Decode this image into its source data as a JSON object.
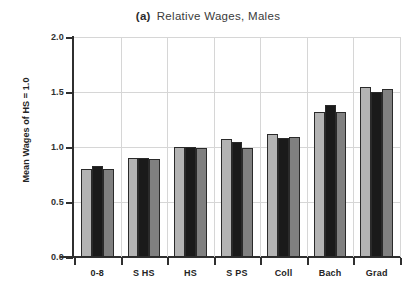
{
  "chart_data": {
    "type": "bar",
    "panel_letter": "(a)",
    "title_text": "Relative Wages, Males",
    "xlabel": "",
    "ylabel": "Mean Wages of HS = 1.0",
    "ylim": [
      0.0,
      2.0
    ],
    "yticks": [
      "0.0",
      "0.5",
      "1.0",
      "1.5",
      "2.0"
    ],
    "ytick_values": [
      0.0,
      0.5,
      1.0,
      1.5,
      2.0
    ],
    "grid": "horizontal-and-vertical",
    "legend": "none",
    "categories": [
      "0-8",
      "S HS",
      "HS",
      "S PS",
      "Coll",
      "Bach",
      "Grad"
    ],
    "series": [
      {
        "name": "series-1",
        "color": "#b3b3b3",
        "values": [
          0.8,
          0.9,
          1.0,
          1.07,
          1.12,
          1.32,
          1.55
        ]
      },
      {
        "name": "series-2",
        "color": "#1a1a1a",
        "values": [
          0.83,
          0.9,
          1.0,
          1.05,
          1.08,
          1.38,
          1.5
        ]
      },
      {
        "name": "series-3",
        "color": "#808080",
        "values": [
          0.8,
          0.89,
          0.99,
          0.99,
          1.09,
          1.32,
          1.53
        ]
      }
    ]
  }
}
